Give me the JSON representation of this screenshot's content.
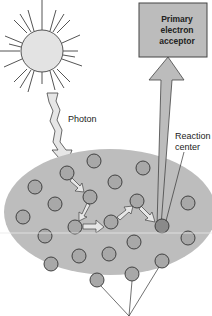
{
  "figure": {
    "labels": {
      "photon": "Photon",
      "reaction_center_line1": "Reaction",
      "reaction_center_line2": "center",
      "acceptor_line1": "Primary",
      "acceptor_line2": "electron",
      "acceptor_line3": "acceptor"
    },
    "colors": {
      "ellipse_fill": "#bdbdbd",
      "pigment_fill": "#a8a8a8",
      "reaction_center_fill": "#8a8a8a",
      "outline": "#333333",
      "arrow_fill": "#e6e6e6",
      "sun_fill": "#e3e3e3",
      "box_fill": "#bcbcbc"
    }
  }
}
